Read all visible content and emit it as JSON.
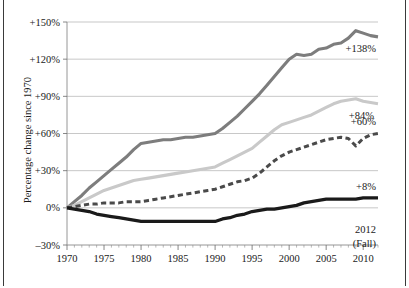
{
  "chart_data": {
    "type": "line",
    "title": "",
    "xlabel": "",
    "ylabel": "Percentage change since 1970",
    "xlim": [
      1970,
      2012
    ],
    "ylim": [
      -30,
      150
    ],
    "ytick_labels": [
      "+150%",
      "+120%",
      "+90%",
      "+60%",
      "+30%",
      "0%",
      "–30%"
    ],
    "ytick_values": [
      150,
      120,
      90,
      60,
      30,
      0,
      -30
    ],
    "xtick_labels": [
      "1970",
      "1975",
      "1980",
      "1985",
      "1990",
      "1995",
      "2000",
      "2005",
      "2010"
    ],
    "xtick_values": [
      1970,
      1975,
      1980,
      1985,
      1990,
      1995,
      2000,
      2005,
      2010
    ],
    "minor_xtick_interval": 1,
    "grid": "horizontal",
    "legend": "none",
    "end_note": [
      "2012",
      "(Fall)"
    ],
    "series": [
      {
        "name": "series-dark-gray-solid",
        "end_label": "+138%",
        "color": "#7d7d7d",
        "style": "solid",
        "width": 3.1,
        "x": [
          1970,
          1971,
          1972,
          1973,
          1974,
          1975,
          1976,
          1977,
          1978,
          1979,
          1980,
          1981,
          1982,
          1983,
          1984,
          1985,
          1986,
          1987,
          1988,
          1989,
          1990,
          1991,
          1992,
          1993,
          1994,
          1995,
          1996,
          1997,
          1998,
          1999,
          2000,
          2001,
          2002,
          2003,
          2004,
          2005,
          2006,
          2007,
          2008,
          2009,
          2010,
          2011,
          2012
        ],
        "y": [
          0,
          5,
          10,
          16,
          21,
          26,
          31,
          36,
          41,
          47,
          52,
          53,
          54,
          55,
          55,
          56,
          57,
          57,
          58,
          59,
          60,
          64,
          69,
          74,
          80,
          86,
          92,
          99,
          106,
          113,
          120,
          124,
          123,
          124,
          128,
          129,
          132,
          133,
          137,
          143,
          141,
          139,
          138
        ]
      },
      {
        "name": "series-light-gray-solid",
        "end_label": "+84%",
        "color": "#c9c9c9",
        "style": "solid",
        "width": 3.1,
        "x": [
          1970,
          1971,
          1972,
          1973,
          1974,
          1975,
          1976,
          1977,
          1978,
          1979,
          1980,
          1981,
          1982,
          1983,
          1984,
          1985,
          1986,
          1987,
          1988,
          1989,
          1990,
          1991,
          1992,
          1993,
          1994,
          1995,
          1996,
          1997,
          1998,
          1999,
          2000,
          2001,
          2002,
          2003,
          2004,
          2005,
          2006,
          2007,
          2008,
          2009,
          2010,
          2011,
          2012
        ],
        "y": [
          0,
          2,
          5,
          8,
          11,
          14,
          16,
          18,
          20,
          22,
          23,
          24,
          25,
          26,
          27,
          28,
          29,
          30,
          31,
          32,
          33,
          36,
          39,
          42,
          45,
          48,
          53,
          58,
          63,
          67,
          69,
          71,
          73,
          75,
          78,
          81,
          84,
          86,
          87,
          88,
          86,
          85,
          84
        ]
      },
      {
        "name": "series-dark-dashed",
        "end_label": "+60%",
        "color": "#4a4a4a",
        "style": "dashed",
        "width": 3.0,
        "x": [
          1970,
          1971,
          1972,
          1973,
          1974,
          1975,
          1976,
          1977,
          1978,
          1979,
          1980,
          1981,
          1982,
          1983,
          1984,
          1985,
          1986,
          1987,
          1988,
          1989,
          1990,
          1991,
          1992,
          1993,
          1994,
          1995,
          1996,
          1997,
          1998,
          1999,
          2000,
          2001,
          2002,
          2003,
          2004,
          2005,
          2006,
          2007,
          2008,
          2009,
          2010,
          2011,
          2012
        ],
        "y": [
          0,
          1,
          2,
          3,
          3,
          4,
          4,
          4,
          5,
          5,
          5,
          6,
          7,
          8,
          9,
          10,
          11,
          12,
          13,
          14,
          15,
          17,
          19,
          21,
          22,
          24,
          28,
          33,
          38,
          42,
          45,
          47,
          49,
          51,
          53,
          55,
          56,
          57,
          56,
          50,
          56,
          59,
          60
        ]
      },
      {
        "name": "series-black-solid",
        "end_label": "+8%",
        "color": "#1a1a1a",
        "style": "solid",
        "width": 3.3,
        "x": [
          1970,
          1971,
          1972,
          1973,
          1974,
          1975,
          1976,
          1977,
          1978,
          1979,
          1980,
          1981,
          1982,
          1983,
          1984,
          1985,
          1986,
          1987,
          1988,
          1989,
          1990,
          1991,
          1992,
          1993,
          1994,
          1995,
          1996,
          1997,
          1998,
          1999,
          2000,
          2001,
          2002,
          2003,
          2004,
          2005,
          2006,
          2007,
          2008,
          2009,
          2010,
          2011,
          2012
        ],
        "y": [
          0,
          -1,
          -2,
          -3,
          -5,
          -6,
          -7,
          -8,
          -9,
          -10,
          -11,
          -11,
          -11,
          -11,
          -11,
          -11,
          -11,
          -11,
          -11,
          -11,
          -11,
          -9,
          -8,
          -6,
          -5,
          -3,
          -2,
          -1,
          -1,
          0,
          1,
          2,
          4,
          5,
          6,
          7,
          7,
          7,
          7,
          7,
          8,
          8,
          8
        ]
      }
    ]
  }
}
